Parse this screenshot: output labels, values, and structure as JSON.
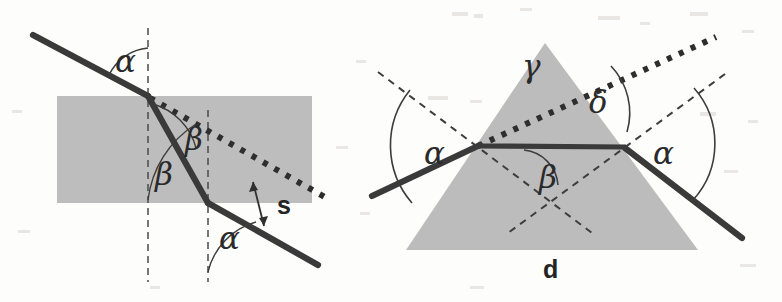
{
  "figure": {
    "background_color": "#fdfdfc",
    "medium_fill": "#bdbdbd",
    "ink_color": "#3a3a3a"
  },
  "slab_diagram": {
    "name": "plane-parallel-slab",
    "labels": {
      "incidence_angle": "α",
      "refraction_angle_upper": "β",
      "refraction_angle_lower": "β",
      "exit_angle": "α",
      "displacement": "s"
    },
    "geometry": {
      "slab_left": 57,
      "slab_right": 312,
      "slab_top": 96,
      "slab_bottom": 203,
      "normal_1_x": 148,
      "normal_2_x": 208,
      "entry_point": [
        148,
        96
      ],
      "exit_point": [
        208,
        203
      ],
      "incident_start": [
        33,
        35
      ],
      "exit_end": [
        318,
        265
      ]
    },
    "elements": [
      "incident ray",
      "refracted ray inside slab",
      "emergent ray parallel to incident ray",
      "dotted continuation of incident ray",
      "two dashed surface normals",
      "double-headed arrow marking lateral displacement s"
    ]
  },
  "prism_diagram": {
    "name": "triangular-prism",
    "labels": {
      "apex_angle": "γ",
      "deviation_angle": "δ",
      "incidence_angle_left": "α",
      "exit_angle_right": "α",
      "internal_angle": "β",
      "base_label": "d"
    },
    "geometry": {
      "apex": [
        545,
        43
      ],
      "base_left": [
        406,
        250
      ],
      "base_right": [
        698,
        250
      ],
      "entry_point": [
        480,
        145
      ],
      "exit_point": [
        625,
        148
      ],
      "incident_start": [
        372,
        196
      ],
      "exit_end": [
        742,
        238
      ],
      "dotted_extension_end": [
        716,
        37
      ]
    },
    "elements": [
      "shaded equilateral prism",
      "incident ray striking the left face",
      "horizontal ray inside the prism",
      "emergent ray leaving the right face",
      "dotted undeviated continuation of the incident ray",
      "dotted bisector through the apex",
      "dashed normals to both refracting faces",
      "base width label d"
    ]
  }
}
